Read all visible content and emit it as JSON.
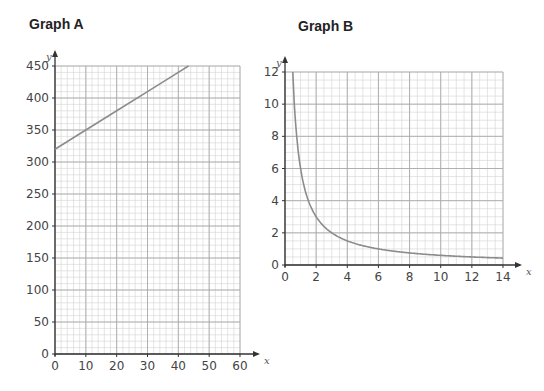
{
  "chart_data": [
    {
      "type": "line",
      "title": "Graph A",
      "xlabel": "x",
      "ylabel": "y",
      "xlim": [
        0,
        60
      ],
      "ylim": [
        0,
        450
      ],
      "grid": true,
      "x_ticks": [
        0,
        10,
        20,
        30,
        40,
        50,
        60
      ],
      "y_ticks": [
        0,
        50,
        100,
        150,
        200,
        250,
        300,
        350,
        400,
        450
      ],
      "series": [
        {
          "name": "line",
          "x": [
            0,
            10,
            20,
            30,
            40,
            43.3
          ],
          "y": [
            320,
            350,
            380,
            410,
            440,
            450
          ]
        }
      ],
      "equation": "y = 3x + 320"
    },
    {
      "type": "line",
      "title": "Graph B",
      "xlabel": "x",
      "ylabel": "y",
      "xlim": [
        0,
        14
      ],
      "ylim": [
        0,
        12
      ],
      "grid": true,
      "x_ticks": [
        0,
        2,
        4,
        6,
        8,
        10,
        12,
        14
      ],
      "y_ticks": [
        0,
        2,
        4,
        6,
        8,
        10,
        12
      ],
      "series": [
        {
          "name": "curve",
          "x": [
            0.5,
            1,
            2,
            3,
            4,
            6,
            8,
            10,
            12,
            14
          ],
          "y": [
            12,
            6,
            3,
            2,
            1.5,
            1,
            0.75,
            0.6,
            0.5,
            0.43
          ]
        }
      ],
      "equation": "y = 6/x"
    }
  ]
}
